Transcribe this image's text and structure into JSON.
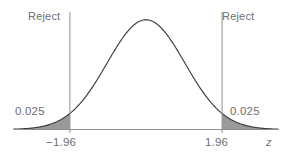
{
  "chart_data": {
    "type": "area",
    "title": "",
    "subtitle": "",
    "xlabel": "z",
    "ylabel": "",
    "grid": false,
    "legend_position": "none",
    "distribution": "standard normal",
    "mean": 0,
    "sd": 1,
    "xlim": [
      -3.4,
      3.4
    ],
    "ylim": [
      0,
      0.42
    ],
    "critical_values": [
      -1.96,
      1.96
    ],
    "tail_areas": [
      0.025,
      0.025
    ],
    "tick_labels": [
      "−1.96",
      "1.96"
    ],
    "annotations": [
      {
        "text": "Reject",
        "x": -1.96,
        "side": "left"
      },
      {
        "text": "Reject",
        "x": 1.96,
        "side": "right"
      },
      {
        "text": "0.025",
        "x": -2.45,
        "region": "left-tail"
      },
      {
        "text": "0.025",
        "x": 2.45,
        "region": "right-tail"
      }
    ],
    "x": [
      -3.4,
      -3.2,
      -3.0,
      -2.8,
      -2.6,
      -2.4,
      -2.2,
      -2.0,
      -1.96,
      -1.8,
      -1.6,
      -1.4,
      -1.2,
      -1.0,
      -0.8,
      -0.6,
      -0.4,
      -0.2,
      0.0,
      0.2,
      0.4,
      0.6,
      0.8,
      1.0,
      1.2,
      1.4,
      1.6,
      1.8,
      1.96,
      2.0,
      2.2,
      2.4,
      2.6,
      2.8,
      3.0,
      3.2,
      3.4
    ],
    "y": [
      0.0012,
      0.0024,
      0.0044,
      0.0079,
      0.0136,
      0.0224,
      0.0355,
      0.054,
      0.0584,
      0.079,
      0.1109,
      0.1497,
      0.1942,
      0.242,
      0.2897,
      0.3332,
      0.3683,
      0.391,
      0.3989,
      0.391,
      0.3683,
      0.3332,
      0.2897,
      0.242,
      0.1942,
      0.1497,
      0.1109,
      0.079,
      0.0584,
      0.054,
      0.0355,
      0.0224,
      0.0136,
      0.0079,
      0.0044,
      0.0024,
      0.0012
    ]
  },
  "labels": {
    "reject_left": "Reject",
    "reject_right": "Reject",
    "area_left": "0.025",
    "area_right": "0.025",
    "tick_left": "−1.96",
    "tick_right": "1.96",
    "axis_z": "z"
  },
  "colors": {
    "curve": "#3b3b3b",
    "axis": "#8f8f8f",
    "critical_line": "#909090",
    "tail_fill": "#9a9a9a",
    "text": "#6f6f6f",
    "background": "#ffffff"
  }
}
